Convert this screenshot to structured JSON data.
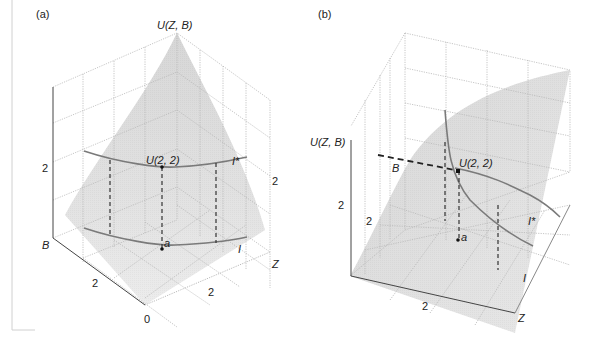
{
  "figure": {
    "panel_a": {
      "label": "(a)",
      "z_axis_title": "U(Z, B)",
      "point_label_top": "U(2, 2)",
      "point_label_bottom": "a",
      "curve_upper_label": "I*",
      "curve_lower_label": "I",
      "b_axis_label": "B",
      "z_axis_label": "Z",
      "tick_u": "2",
      "tick_b": "2",
      "tick_z": "2",
      "tick_z_vertical": "2",
      "origin": "0"
    },
    "panel_b": {
      "label": "(b)",
      "u_axis_title": "U(Z, B)",
      "point_label_top": "U(2, 2)",
      "point_label_bottom": "a",
      "b_label": "B",
      "curve_upper_label": "I*",
      "curve_lower_label": "I",
      "z_axis_label": "Z",
      "tick_u": "2",
      "tick_b": "2",
      "tick_z": "2"
    },
    "colors": {
      "surface": "#d6d6d6",
      "surface_light": "#ececec",
      "grid": "#b8b8b8",
      "curve": "#7a7a7a",
      "text": "#222222"
    }
  }
}
